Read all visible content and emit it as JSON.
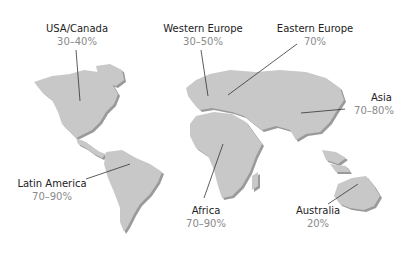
{
  "map": {
    "land_color": "#c8c8c8",
    "shadow_color": "#9a9a9a",
    "leader_color": "#333333",
    "regions": [
      {
        "id": "usa-canada",
        "name": "USA/Canada",
        "value": "30–40%"
      },
      {
        "id": "western-europe",
        "name": "Western Europe",
        "value": "30–50%"
      },
      {
        "id": "eastern-europe",
        "name": "Eastern Europe",
        "value": "70%"
      },
      {
        "id": "asia",
        "name": "Asia",
        "value": "70–80%"
      },
      {
        "id": "latin-america",
        "name": "Latin America",
        "value": "70–90%"
      },
      {
        "id": "africa",
        "name": "Africa",
        "value": "70–90%"
      },
      {
        "id": "australia",
        "name": "Australia",
        "value": "20%"
      }
    ]
  }
}
